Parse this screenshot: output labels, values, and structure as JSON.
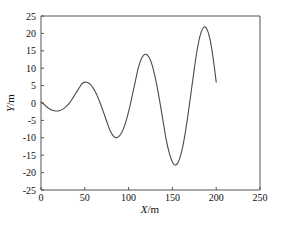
{
  "chart_data": {
    "type": "line",
    "title": "",
    "subtitle": "",
    "xlabel": "X/m",
    "ylabel": "Y/m",
    "xlabel_parts": {
      "symbol": "X",
      "unit": "/m"
    },
    "ylabel_parts": {
      "symbol": "Y",
      "unit": "/m"
    },
    "xlim": [
      0,
      250
    ],
    "ylim": [
      -25,
      25
    ],
    "xticks": [
      0,
      50,
      100,
      150,
      200,
      250
    ],
    "yticks": [
      25,
      20,
      15,
      10,
      5,
      0,
      -5,
      -10,
      -15,
      -20,
      -25
    ],
    "xtick_labels": [
      "0",
      "50",
      "100",
      "150",
      "200",
      "250"
    ],
    "ytick_labels": [
      "25",
      "20",
      "15",
      "10",
      "5",
      "0",
      "-5",
      "-10",
      "-15",
      "-20",
      "-25"
    ],
    "grid": false,
    "legend": false,
    "legend_position": "none",
    "line_color": "#4a4a4a",
    "frame_color": "#555555",
    "background_color": "#ffffff",
    "series": [
      {
        "name": "trajectory",
        "x": [
          0,
          3,
          6,
          9,
          12,
          15,
          18,
          21,
          24,
          27,
          30,
          33,
          36,
          39,
          42,
          45,
          47,
          50,
          53,
          56,
          59,
          62,
          65,
          68,
          71,
          74,
          77,
          79,
          82,
          85,
          88,
          91,
          94,
          97,
          100,
          103,
          106,
          109,
          111,
          114,
          117,
          120,
          123,
          126,
          129,
          132,
          135,
          138,
          141,
          143,
          146,
          149,
          152,
          155,
          158,
          161,
          164,
          167,
          170,
          172,
          174,
          177,
          180,
          183,
          186,
          189,
          192,
          195,
          198,
          200
        ],
        "y": [
          0.3,
          -0.3,
          -1.0,
          -1.6,
          -2.0,
          -2.2,
          -2.3,
          -2.2,
          -1.9,
          -1.4,
          -0.7,
          0.2,
          1.3,
          2.5,
          3.7,
          4.9,
          5.6,
          6.0,
          5.9,
          5.4,
          4.5,
          3.2,
          1.6,
          -0.3,
          -2.4,
          -4.6,
          -6.7,
          -8.0,
          -9.3,
          -9.9,
          -9.8,
          -9.0,
          -7.5,
          -5.3,
          -2.5,
          0.8,
          4.3,
          7.8,
          10.0,
          12.4,
          13.7,
          14.0,
          13.3,
          11.6,
          8.9,
          5.4,
          1.3,
          -3.2,
          -7.7,
          -10.6,
          -14.0,
          -16.4,
          -17.7,
          -17.6,
          -16.2,
          -13.5,
          -9.6,
          -4.8,
          0.6,
          4.3,
          8.0,
          13.3,
          17.6,
          20.5,
          21.8,
          21.4,
          19.3,
          15.5,
          10.1,
          6.0
        ],
        "annotations": [
          {
            "label": "peak 1",
            "x": 47,
            "y": 6.0
          },
          {
            "label": "trough 1",
            "x": 79,
            "y": -10.0
          },
          {
            "label": "peak 2",
            "x": 111,
            "y": 14.0
          },
          {
            "label": "trough 2",
            "x": 143,
            "y": -17.8
          },
          {
            "label": "peak 3",
            "x": 174,
            "y": 21.8
          },
          {
            "label": "end",
            "x": 200,
            "y": -23.9
          }
        ]
      }
    ]
  }
}
